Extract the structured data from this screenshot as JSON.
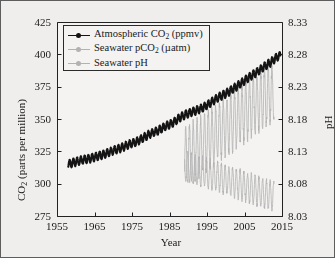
{
  "figure": {
    "background_color": "#efeeec",
    "border_color": "#5d5d5d",
    "plot_background_color": "#f4f3f1"
  },
  "axis_titles": {
    "left": "CO₂ (parts per million)",
    "right": "pH",
    "bottom": "Year"
  },
  "legend": {
    "entries": [
      {
        "label_html": "Atmospheric CO<sub>2</sub> (ppmv)",
        "label": "Atmospheric CO2 (ppmv)",
        "color": "#141414",
        "marker": "line-with-dot"
      },
      {
        "label_html": "Seawater pCO<sub>2</sub> (µatm)",
        "label": "Seawater pCO2 (µatm)",
        "color": "#b2b2b2",
        "marker": "line-with-dot"
      },
      {
        "label_html": "Seawater pH",
        "label": "Seawater pH",
        "color": "#b2b2b2",
        "marker": "line-with-dot"
      }
    ]
  },
  "chart_data": {
    "type": "line",
    "title": "",
    "xlabel": "Year",
    "ylabel": "CO₂ (parts per million)",
    "y2label": "pH",
    "xlim": [
      1955,
      2015
    ],
    "ylim": [
      275,
      425
    ],
    "y2lim": [
      8.03,
      8.33
    ],
    "xticks": [
      1955,
      1965,
      1975,
      1985,
      1995,
      2005,
      2015
    ],
    "yticks": [
      275,
      300,
      325,
      350,
      375,
      400,
      425
    ],
    "y2ticks": [
      "8.03",
      "8.08",
      "8.13",
      "8.18",
      "8.23",
      "8.28",
      "8.33"
    ],
    "grid": false,
    "legend_position": "upper-left-inside",
    "series": [
      {
        "name": "Atmospheric CO2 (ppmv)",
        "axis": "left",
        "unit": "ppmv",
        "color": "#141414",
        "style": "line-with-markers",
        "seasonal_amplitude": 3.0,
        "x": [
          1958,
          1960,
          1962,
          1964,
          1966,
          1968,
          1970,
          1972,
          1974,
          1976,
          1978,
          1980,
          1982,
          1984,
          1986,
          1988,
          1990,
          1992,
          1994,
          1996,
          1998,
          2000,
          2002,
          2004,
          2006,
          2008,
          2010,
          2012,
          2014
        ],
        "values": [
          315.0,
          316.9,
          318.4,
          319.6,
          321.4,
          323.1,
          325.7,
          327.5,
          330.2,
          332.1,
          335.4,
          338.7,
          341.1,
          344.4,
          347.2,
          351.6,
          354.4,
          356.4,
          358.8,
          362.6,
          366.7,
          369.6,
          373.3,
          377.5,
          381.9,
          385.6,
          389.9,
          393.8,
          398.6
        ]
      },
      {
        "name": "Seawater pCO2 (µatm)",
        "axis": "left",
        "unit": "µatm",
        "color": "#b2b2b2",
        "style": "line-with-markers-high-frequency",
        "seasonal_amplitude": 22.0,
        "x": [
          1989,
          1990,
          1991,
          1992,
          1993,
          1994,
          1995,
          1996,
          1997,
          1998,
          1999,
          2000,
          2001,
          2002,
          2003,
          2004,
          2005,
          2006,
          2007,
          2008,
          2009,
          2010,
          2011,
          2012
        ],
        "values": [
          320.0,
          322.0,
          324.0,
          326.5,
          328.0,
          330.0,
          333.0,
          335.0,
          337.5,
          340.0,
          342.0,
          344.5,
          346.0,
          348.5,
          351.0,
          353.0,
          355.5,
          358.0,
          360.0,
          362.5,
          364.0,
          366.5,
          368.0,
          370.0
        ]
      },
      {
        "name": "Seawater pH",
        "axis": "right",
        "unit": "pH",
        "color": "#b2b2b2",
        "style": "line-with-markers-high-frequency",
        "seasonal_amplitude": 0.022,
        "x": [
          1989,
          1990,
          1991,
          1992,
          1993,
          1994,
          1995,
          1996,
          1997,
          1998,
          1999,
          2000,
          2001,
          2002,
          2003,
          2004,
          2005,
          2006,
          2007,
          2008,
          2009,
          2010,
          2011,
          2012
        ],
        "values": [
          8.108,
          8.106,
          8.104,
          8.102,
          8.1,
          8.098,
          8.096,
          8.094,
          8.092,
          8.09,
          8.088,
          8.086,
          8.084,
          8.082,
          8.08,
          8.078,
          8.076,
          8.074,
          8.072,
          8.07,
          8.068,
          8.066,
          8.064,
          8.062
        ]
      }
    ]
  }
}
